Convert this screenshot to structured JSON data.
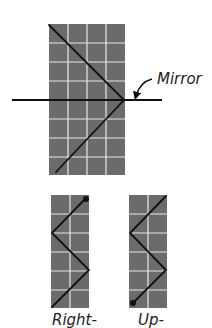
{
  "diagram": {
    "title": "",
    "colors": {
      "cell": "#6b6b6b",
      "gridline": "#e8e8e8",
      "path": "#111111",
      "background": "#ffffff"
    },
    "top_grid": {
      "cols": 4,
      "rows": 8,
      "description": "Light path reflecting off a horizontal mirror"
    },
    "mirror_label": "Mirror",
    "bottom_left": {
      "cols": 2,
      "rows": 6,
      "label": "Right-",
      "description": "Zigzag path starting at top-right dot"
    },
    "bottom_right": {
      "cols": 2,
      "rows": 6,
      "label": "Up-",
      "description": "Zigzag path starting at bottom-left dot"
    }
  }
}
